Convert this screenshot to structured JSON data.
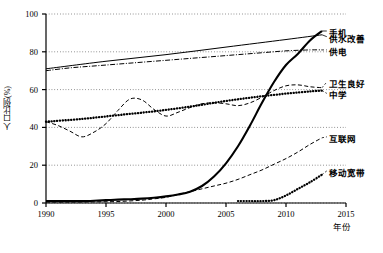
{
  "chart_data": {
    "type": "line",
    "title": "",
    "xlabel": "年份",
    "ylabel": "人口比例(%)",
    "xlim": [
      1990,
      2015
    ],
    "ylim": [
      0,
      100
    ],
    "xticks": [
      "1990",
      "1995",
      "2000",
      "2005",
      "2010",
      "2015"
    ],
    "yticks": [
      "0",
      "20",
      "40",
      "60",
      "80",
      "100"
    ],
    "grid": "horizontal-dotted",
    "legend_position": "right-inline-labels",
    "series": [
      {
        "name": "手机",
        "style": "solid-thick",
        "label_anchor": {
          "x": 2013.4,
          "y": 91
        },
        "x": [
          1990,
          1991,
          1992,
          1993,
          1994,
          1995,
          1996,
          1997,
          1998,
          1999,
          2000,
          2001,
          2002,
          2003,
          2004,
          2005,
          2006,
          2007,
          2008,
          2009,
          2010,
          2011,
          2012,
          2013
        ],
        "values": [
          1,
          1,
          1,
          1,
          1.2,
          1.5,
          1.8,
          2,
          2.3,
          2.8,
          3.5,
          4.5,
          6,
          9,
          14,
          21,
          30,
          41,
          53,
          64,
          73,
          79,
          86,
          91
        ]
      },
      {
        "name": "供水改善",
        "style": "solid-thin",
        "label_anchor": {
          "x": 2013.4,
          "y": 88
        },
        "x": [
          1990,
          1995,
          2000,
          2005,
          2010,
          2013
        ],
        "values": [
          71,
          75,
          78.5,
          82.5,
          86.5,
          89
        ]
      },
      {
        "name": "供电",
        "style": "dash-dot",
        "label_anchor": {
          "x": 2013.4,
          "y": 81
        },
        "x": [
          1990,
          1992,
          1994,
          1996,
          1998,
          2000,
          2002,
          2004,
          2006,
          2008,
          2010,
          2012,
          2013
        ],
        "values": [
          70,
          71.5,
          72.5,
          73.5,
          74.5,
          75.5,
          76.5,
          77.5,
          78.5,
          79.5,
          80.5,
          81,
          81
        ]
      },
      {
        "name": "卫生良好",
        "style": "dashed",
        "label_anchor": {
          "x": 2013.4,
          "y": 64
        },
        "x": [
          1990,
          1991,
          1992,
          1993,
          1994,
          1995,
          1996,
          1997,
          1998,
          1999,
          2000,
          2001,
          2002,
          2003,
          2004,
          2005,
          2006,
          2007,
          2008,
          2009,
          2010,
          2011,
          2012,
          2013
        ],
        "values": [
          43,
          41,
          38,
          35,
          37.5,
          42,
          49,
          55,
          54.5,
          49.5,
          46,
          48,
          50.5,
          52.5,
          53,
          52.5,
          51.5,
          53,
          56,
          59.5,
          62,
          62.5,
          61.5,
          61
        ]
      },
      {
        "name": "中学",
        "style": "dotted-thick",
        "label_anchor": {
          "x": 2013.4,
          "y": 58
        },
        "x": [
          1990,
          1993,
          1996,
          1999,
          2002,
          2005,
          2008,
          2011,
          2013
        ],
        "values": [
          43,
          44.5,
          46.5,
          48.5,
          51,
          54,
          56.5,
          58.5,
          59.5
        ]
      },
      {
        "name": "互联网",
        "style": "dashed",
        "label_anchor": {
          "x": 2013.4,
          "y": 35
        },
        "x": [
          1990,
          1992,
          1994,
          1996,
          1998,
          1999,
          2000,
          2001,
          2002,
          2003,
          2004,
          2005,
          2006,
          2007,
          2008,
          2009,
          2010,
          2011,
          2012,
          2013
        ],
        "values": [
          0.5,
          0.5,
          0.6,
          0.8,
          1.5,
          2.2,
          3,
          4.5,
          6,
          7.5,
          9,
          10.5,
          12.5,
          15,
          17.5,
          20.5,
          23.5,
          27,
          31,
          34.5
        ]
      },
      {
        "name": "移动宽带",
        "style": "dotted-thick",
        "label_anchor": {
          "x": 2013.4,
          "y": 17
        },
        "x": [
          2006,
          2007,
          2008,
          2009,
          2010,
          2011,
          2012,
          2013
        ],
        "values": [
          1,
          1,
          1,
          1.5,
          4,
          7.5,
          11,
          15
        ]
      }
    ]
  },
  "axes": {
    "y_title": "人口比例(%)",
    "x_title": "年份",
    "yticks": [
      {
        "label": "100",
        "value": 100
      },
      {
        "label": "80",
        "value": 80
      },
      {
        "label": "60",
        "value": 60
      },
      {
        "label": "40",
        "value": 40
      },
      {
        "label": "20",
        "value": 20
      },
      {
        "label": "0",
        "value": 0
      }
    ],
    "xticks": [
      {
        "label": "1990",
        "value": 1990
      },
      {
        "label": "1995",
        "value": 1995
      },
      {
        "label": "2000",
        "value": 2000
      },
      {
        "label": "2005",
        "value": 2005
      },
      {
        "label": "2010",
        "value": 2010
      },
      {
        "label": "2015",
        "value": 2015
      }
    ]
  },
  "series_labels": {
    "mobile_phone": "手机",
    "water_supply": "供水改善",
    "electricity": "供电",
    "sanitation": "卫生良好",
    "secondary_school": "中学",
    "internet": "互联网",
    "mobile_broadband": "移动宽带"
  },
  "caption": ""
}
